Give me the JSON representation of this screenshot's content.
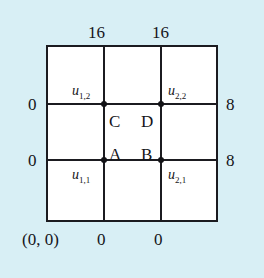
{
  "figure": {
    "background_color": "#d8eff5",
    "grid_color": "#1b1b20",
    "cell_color": "#ffffff"
  },
  "boundary": {
    "top": [
      {
        "value": "16",
        "position": "top-left-interior-column"
      },
      {
        "value": "16",
        "position": "top-right-interior-column"
      }
    ],
    "left": [
      {
        "value": "0",
        "position": "left-upper-interior-row"
      },
      {
        "value": "0",
        "position": "left-lower-interior-row"
      }
    ],
    "right": [
      {
        "value": "8",
        "position": "right-upper-interior-row"
      },
      {
        "value": "8",
        "position": "right-lower-interior-row"
      }
    ],
    "bottom": [
      {
        "value": "0",
        "position": "bottom-left-interior-column"
      },
      {
        "value": "0",
        "position": "bottom-right-interior-column"
      }
    ],
    "origin": "(0, 0)"
  },
  "nodes": [
    {
      "id": "u11",
      "base": "u",
      "sub": "1,1",
      "x": 1,
      "y": 1
    },
    {
      "id": "u21",
      "base": "u",
      "sub": "2,1",
      "x": 2,
      "y": 1
    },
    {
      "id": "u12",
      "base": "u",
      "sub": "1,2",
      "x": 1,
      "y": 2
    },
    {
      "id": "u22",
      "base": "u",
      "sub": "2,2",
      "x": 2,
      "y": 2
    }
  ],
  "regions": [
    {
      "id": "A",
      "label": "A"
    },
    {
      "id": "B",
      "label": "B"
    },
    {
      "id": "C",
      "label": "C"
    },
    {
      "id": "D",
      "label": "D"
    }
  ],
  "chart_data": {
    "type": "diagram",
    "grid": {
      "columns": 3,
      "rows": 3
    },
    "interior_unknowns": [
      "u_1,1",
      "u_2,1",
      "u_1,2",
      "u_2,2"
    ],
    "region_labels": [
      "A",
      "B",
      "C",
      "D"
    ],
    "boundary_values": {
      "top": [
        16,
        16
      ],
      "left": [
        0,
        0
      ],
      "right": [
        8,
        8
      ],
      "bottom": [
        0,
        0
      ],
      "origin_corner": "(0, 0)"
    }
  }
}
